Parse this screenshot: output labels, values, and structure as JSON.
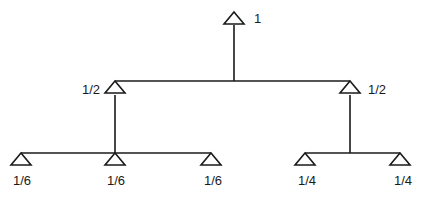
{
  "diagram": {
    "type": "tree",
    "root": {
      "label": "1"
    },
    "level1": [
      {
        "label": "1/2"
      },
      {
        "label": "1/2"
      }
    ],
    "level2_left": [
      {
        "label": "1/6"
      },
      {
        "label": "1/6"
      },
      {
        "label": "1/6"
      }
    ],
    "level2_right": [
      {
        "label": "1/4"
      },
      {
        "label": "1/4"
      }
    ]
  }
}
